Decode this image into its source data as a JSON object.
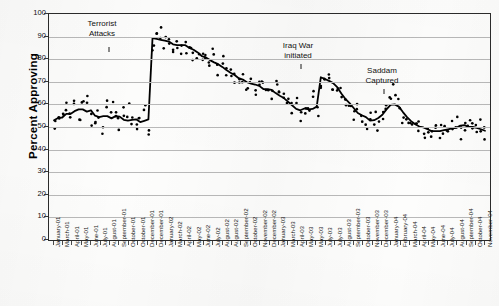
{
  "chart_data": {
    "type": "line",
    "title": "",
    "subtitle": "",
    "xlabel": "",
    "ylabel": "Percent Approving",
    "ylim": [
      0,
      100
    ],
    "ytick_step": 10,
    "ytick_labels": [
      "100",
      "90",
      "80",
      "70",
      "60",
      "50",
      "40",
      "30",
      "20",
      "10",
      "0"
    ],
    "grid": true,
    "grid_axis": "y",
    "legend": "none",
    "series": [
      {
        "name": "Presidential approval (individual polls)",
        "marker": "small filled circle",
        "color": "#000000",
        "style": "scatter",
        "x": [
          "2001-01",
          "2001-01",
          "2001-02",
          "2001-02",
          "2001-02",
          "2001-03",
          "2001-03",
          "2001-03",
          "2001-04",
          "2001-04",
          "2001-04",
          "2001-05",
          "2001-05",
          "2001-05",
          "2001-06",
          "2001-06",
          "2001-06",
          "2001-07",
          "2001-07",
          "2001-07",
          "2001-08",
          "2001-08",
          "2001-08",
          "2001-09",
          "2001-09",
          "2001-09",
          "2001-09",
          "2001-10",
          "2001-10",
          "2001-10",
          "2001-11",
          "2001-11",
          "2001-12",
          "2001-12",
          "2002-01",
          "2002-01",
          "2002-02",
          "2002-02",
          "2002-03",
          "2002-03",
          "2002-04",
          "2002-04",
          "2002-05",
          "2002-05",
          "2002-06",
          "2002-06",
          "2002-07",
          "2002-07",
          "2002-08",
          "2002-08",
          "2002-09",
          "2002-09",
          "2002-10",
          "2002-10",
          "2002-11",
          "2002-11",
          "2002-12",
          "2002-12",
          "2003-01",
          "2003-01",
          "2003-02",
          "2003-02",
          "2003-03",
          "2003-03",
          "2003-03",
          "2003-04",
          "2003-04",
          "2003-04",
          "2003-05",
          "2003-05",
          "2003-06",
          "2003-06",
          "2003-07",
          "2003-07",
          "2003-08",
          "2003-08",
          "2003-09",
          "2003-09",
          "2003-10",
          "2003-10",
          "2003-11",
          "2003-11",
          "2003-12",
          "2003-12",
          "2004-01",
          "2004-01",
          "2004-02",
          "2004-02",
          "2004-03",
          "2004-03",
          "2004-04",
          "2004-04",
          "2004-05",
          "2004-05",
          "2004-06",
          "2004-06",
          "2004-07",
          "2004-07",
          "2004-08",
          "2004-08",
          "2004-09",
          "2004-09",
          "2004-10",
          "2004-10",
          "2004-11",
          "2004-11"
        ],
        "values": [
          50,
          53,
          56,
          57,
          55,
          58,
          53,
          62,
          61,
          55,
          53,
          56,
          50,
          58,
          57,
          53,
          51,
          55,
          57,
          50,
          51,
          53,
          56,
          51,
          86,
          90,
          92,
          88,
          87,
          84,
          88,
          86,
          86,
          87,
          84,
          82,
          82,
          80,
          79,
          81,
          76,
          77,
          76,
          73,
          74,
          70,
          72,
          69,
          70,
          68,
          67,
          70,
          66,
          63,
          68,
          65,
          63,
          60,
          58,
          60,
          57,
          55,
          57,
          62,
          58,
          70,
          72,
          74,
          69,
          67,
          65,
          63,
          60,
          57,
          58,
          54,
          52,
          55,
          53,
          50,
          55,
          57,
          62,
          65,
          60,
          56,
          52,
          50,
          54,
          51,
          49,
          47,
          48,
          50,
          47,
          49,
          47,
          50,
          52,
          49,
          50,
          52,
          51,
          48,
          49,
          48
        ]
      },
      {
        "name": "Smoothed trend (lowess)",
        "style": "line",
        "color": "#000000",
        "linewidth": 1.8
      }
    ],
    "annotations": [
      {
        "text_line1": "Terrorist",
        "text_line2": "Attacks",
        "points_to": "2001-09",
        "value_at": 51
      },
      {
        "text_line1": "Iraq War",
        "text_line2": "initiated",
        "points_to": "2003-03",
        "value_at": 71
      },
      {
        "text_line1": "Saddam",
        "text_line2": "Captured",
        "points_to": "2003-12",
        "value_at": 62
      }
    ],
    "xtick_labels": [
      "January-01",
      "March-01",
      "April-01",
      "May-01",
      "June-01",
      "July-01",
      "August-01",
      "September-01",
      "October-01",
      "October-01",
      "December-01",
      "December-01",
      "January-02",
      "March-02",
      "April-02",
      "May-02",
      "June-02",
      "July-02",
      "August-02",
      "August-02",
      "September-02",
      "October-02",
      "November-02",
      "December-02",
      "January-03",
      "March-03",
      "April-03",
      "May-03",
      "May-03",
      "July-03",
      "July-03",
      "August-03",
      "September-03",
      "October-03",
      "November-03",
      "December-03",
      "January-04",
      "February-04",
      "March-04",
      "April-04",
      "May-04",
      "June-04",
      "July-04",
      "August-04",
      "September-04",
      "October-04",
      "November-04"
    ]
  }
}
